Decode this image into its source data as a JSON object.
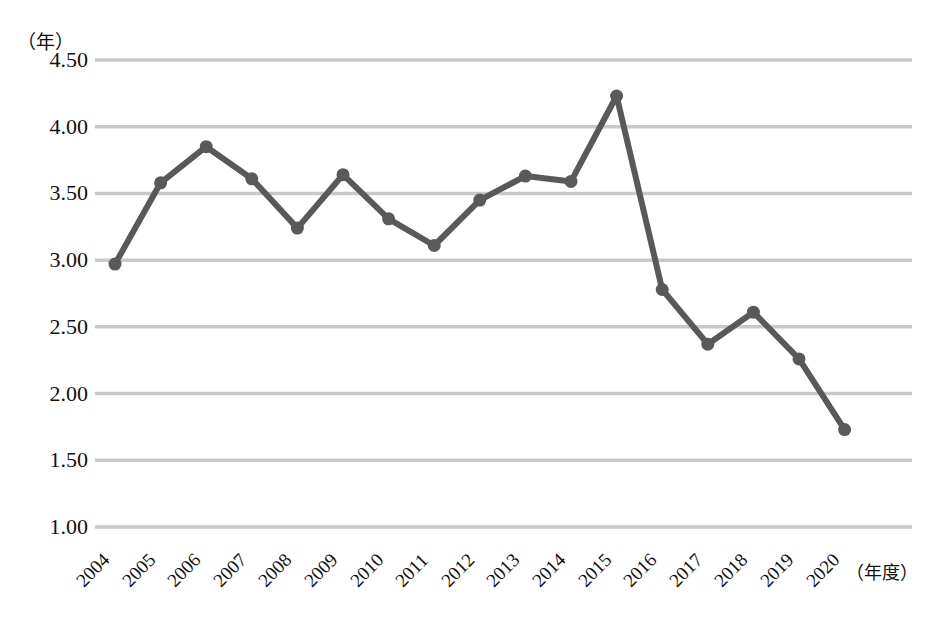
{
  "chart_data": {
    "type": "line",
    "title": "",
    "xlabel": "（年度）",
    "ylabel": "（年）",
    "categories": [
      "2004",
      "2005",
      "2006",
      "2007",
      "2008",
      "2009",
      "2010",
      "2011",
      "2012",
      "2013",
      "2014",
      "2015",
      "2016",
      "2017",
      "2018",
      "2019",
      "2020"
    ],
    "values": [
      2.97,
      3.58,
      3.85,
      3.61,
      3.24,
      3.64,
      3.31,
      3.11,
      3.45,
      3.63,
      3.59,
      4.23,
      2.78,
      2.37,
      2.61,
      2.26,
      1.73
    ],
    "series": [
      {
        "name": "",
        "values": [
          2.97,
          3.58,
          3.85,
          3.61,
          3.24,
          3.64,
          3.31,
          3.11,
          3.45,
          3.63,
          3.59,
          4.23,
          2.78,
          2.37,
          2.61,
          2.26,
          1.73
        ]
      }
    ],
    "ylim": [
      1.0,
      4.5
    ],
    "ytick_labels": [
      "4.50",
      "4.00",
      "3.50",
      "3.00",
      "2.50",
      "2.00",
      "1.50",
      "1.00"
    ],
    "ytick_values": [
      4.5,
      4.0,
      3.5,
      3.0,
      2.5,
      2.0,
      1.5,
      1.0
    ],
    "ytick_step": 0.5,
    "grid": true,
    "grid_color": "#c9c9c9",
    "legend": false,
    "legend_position": "none",
    "line_color": "#595959",
    "marker_color": "#595959",
    "marker": "circle",
    "line_width": 6,
    "background": "#ffffff",
    "axis_line": false,
    "xtick_rotation": -45
  },
  "axes": {
    "y_unit": "（年）",
    "x_unit": "（年度）"
  }
}
